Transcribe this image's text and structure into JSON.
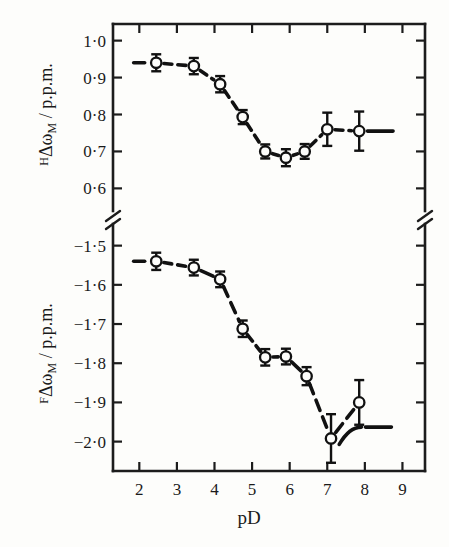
{
  "chart_data": {
    "type": "line",
    "title": "",
    "subtitle": "",
    "xlabel": "pD",
    "xlim": [
      1.3,
      9.6
    ],
    "xticks": [
      2,
      3,
      4,
      5,
      6,
      7,
      8,
      9
    ],
    "xticklabels": [
      "2",
      "3",
      "4",
      "5",
      "6",
      "7",
      "8",
      "9"
    ],
    "grid": false,
    "legend": null,
    "axis_break": true,
    "marker_style": "open-circle",
    "line_style": "dashed",
    "error_bars": "vertical",
    "panels": [
      {
        "name": "upper-panel",
        "ylabel": "ᴴΔωₘ / p.p.m.",
        "ylabel_prefix": "H",
        "ylabel_body": "Δω",
        "ylabel_sub": "M",
        "ylabel_unit": "/ p.p.m.",
        "ylim": [
          0.555,
          1.045
        ],
        "yticks": [
          1.0,
          0.9,
          0.8,
          0.7,
          0.6
        ],
        "yticklabels": [
          "1·0",
          "0·9",
          "0·8",
          "0·7",
          "0·6"
        ],
        "series": [
          {
            "name": "H-delta-omega-M",
            "x": [
              2.45,
              3.45,
              4.15,
              4.75,
              5.35,
              5.9,
              6.4,
              7.0,
              7.85
            ],
            "y": [
              0.94,
              0.931,
              0.882,
              0.793,
              0.7,
              0.683,
              0.7,
              0.76,
              0.755
            ],
            "yerr": [
              0.023,
              0.022,
              0.022,
              0.019,
              0.019,
              0.023,
              0.02,
              0.045,
              0.053
            ]
          }
        ],
        "lead_in_line": {
          "x0": 1.85,
          "x1": 2.45,
          "y": 0.94
        },
        "tail_line": {
          "x0": 7.85,
          "x1": 8.75,
          "y": 0.755
        }
      },
      {
        "name": "lower-panel",
        "ylabel": "ᶠΔωₘ / p.p.m.",
        "ylabel_prefix": "F",
        "ylabel_body": "Δω",
        "ylabel_sub": "M",
        "ylabel_unit": "/ p.p.m.",
        "ylim": [
          -2.075,
          -1.455
        ],
        "yticks": [
          -1.5,
          -1.6,
          -1.7,
          -1.8,
          -1.9,
          -2.0
        ],
        "yticklabels": [
          "−1·5",
          "−1·6",
          "−1·7",
          "−1·8",
          "−1·9",
          "−2·0"
        ],
        "series": [
          {
            "name": "F-delta-omega-M",
            "x": [
              2.45,
              3.45,
              4.15,
              4.75,
              5.35,
              5.9,
              6.45,
              7.1,
              7.85
            ],
            "y": [
              -1.54,
              -1.556,
              -1.586,
              -1.712,
              -1.785,
              -1.783,
              -1.833,
              -1.992,
              -1.9
            ],
            "yerr": [
              0.022,
              0.02,
              0.02,
              0.021,
              0.021,
              0.02,
              0.023,
              0.062,
              0.057
            ]
          }
        ],
        "lead_in_line": {
          "x0": 1.85,
          "x1": 2.45,
          "y": -1.54
        },
        "tail_line": {
          "x0": 7.85,
          "x1": 8.75,
          "y": -1.963
        }
      }
    ]
  },
  "colors": {
    "ink": "#111111",
    "paper": "#fdfdfb",
    "axis": "#1c1c1c"
  }
}
